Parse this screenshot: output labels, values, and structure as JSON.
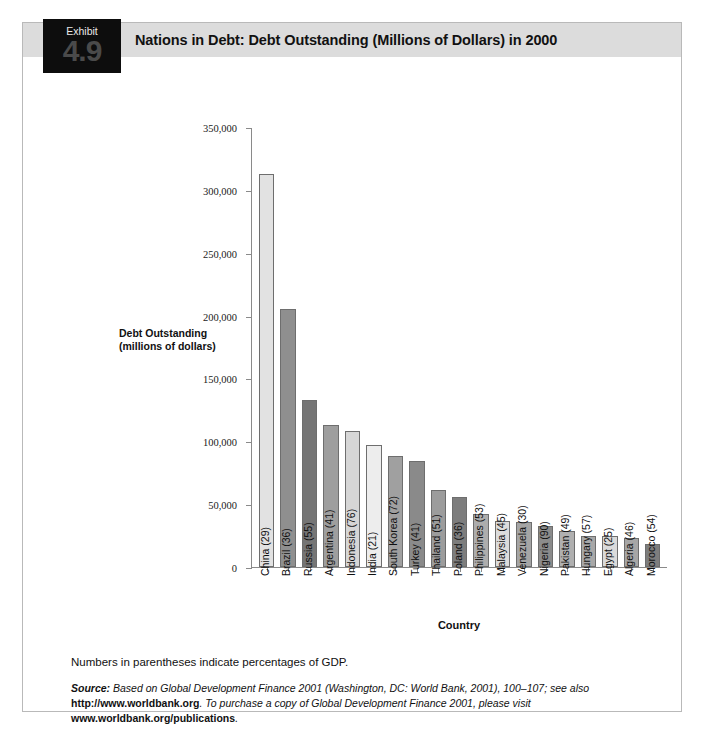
{
  "exhibit": {
    "label": "Exhibit",
    "number": "4.9",
    "title": "Nations in Debt: Debt Outstanding (Millions of Dollars) in 2000"
  },
  "notes": {
    "gdp": "Numbers in parentheses indicate percentages of GDP.",
    "source_prefix": "Source:",
    "source_lead": " Based on ",
    "source_work1": "Global Development Finance 2001",
    "source_mid1": " (Washington, DC: World Bank, 2001), 100–107; see also ",
    "source_url1": "http://www.worldbank.org",
    "source_mid2": ". To purchase a copy of ",
    "source_work2": "Global Development Finance 2001",
    "source_mid3": ", please visit ",
    "source_url2": "www.worldbank.org/publications",
    "source_end": "."
  },
  "chart_data": {
    "type": "bar",
    "title": "Nations in Debt: Debt Outstanding (Millions of Dollars) in 2000",
    "xlabel": "Country",
    "ylabel": "Debt Outstanding (millions of dollars)",
    "ylabel_line1": "Debt Outstanding",
    "ylabel_line2": "(millions of dollars)",
    "ylim": [
      0,
      350000
    ],
    "ytick_values": [
      0,
      50000,
      100000,
      150000,
      200000,
      250000,
      300000,
      350000
    ],
    "ytick_labels": [
      "0",
      "50,000",
      "100,000",
      "150,000",
      "200,000",
      "250,000",
      "300,000",
      "350,000"
    ],
    "grid": false,
    "legend": "none",
    "categories": [
      "China (29)",
      "Brazil (36)",
      "Russia (55)",
      "Argentina (41)",
      "Indonesia (76)",
      "India (21)",
      "South Korea (72)",
      "Turkey (41)",
      "Thailand (51)",
      "Poland (36)",
      "Philippines (53)",
      "Malaysia (45)",
      "Venezuela (30)",
      "Nigeria (90)",
      "Pakistan (49)",
      "Hungary (57)",
      "Egypt (25)",
      "Algeria (46)",
      "Morocco (54)"
    ],
    "values": [
      313000,
      205000,
      133000,
      113000,
      108000,
      97000,
      88000,
      84000,
      61000,
      56000,
      42000,
      37000,
      36000,
      33000,
      29000,
      25000,
      25000,
      23000,
      18000
    ],
    "bar_colors": [
      "#e2e2e2",
      "#8f8f8f",
      "#757575",
      "#9e9e9e",
      "#d6d6d6",
      "#ededed",
      "#a0a0a0",
      "#8a8a8a",
      "#9c9c9c",
      "#7d7d7d",
      "#adadad",
      "#dcdcdc",
      "#a5a5a5",
      "#8b8b8b",
      "#b0b0b0",
      "#a8a8a8",
      "#dadada",
      "#a6a6a6",
      "#7d7d7d",
      "#9f9f9f"
    ]
  }
}
